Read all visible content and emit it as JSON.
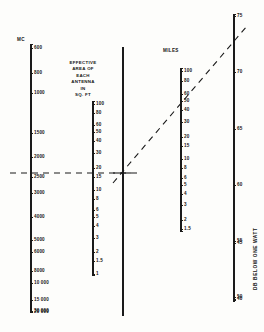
{
  "figure": {
    "type": "nomogram",
    "background_color": "#fdfdfb",
    "line_color": "#1a1a1a"
  },
  "scales": {
    "frequency": {
      "title": "MC",
      "axis_x": 30,
      "axis_top": 44,
      "axis_bottom": 312,
      "tick_side": "right",
      "label_dx": 4,
      "ticks": [
        {
          "label": "600",
          "y": 48
        },
        {
          "label": "800",
          "y": 73
        },
        {
          "label": "1000",
          "y": 93
        },
        {
          "label": "1500",
          "y": 133
        },
        {
          "label": "2000",
          "y": 157
        },
        {
          "label": "2500",
          "y": 177
        },
        {
          "label": "3000",
          "y": 193
        },
        {
          "label": "4000",
          "y": 217
        },
        {
          "label": "5000",
          "y": 240
        },
        {
          "label": "6000",
          "y": 252
        },
        {
          "label": "8000",
          "y": 271
        },
        {
          "label": "10 000",
          "y": 283
        },
        {
          "label": "15 000",
          "y": 300
        },
        {
          "label": "20 000",
          "y": 312
        }
      ]
    },
    "area": {
      "title_lines": [
        "EFFECTIVE",
        "AREA OF",
        "EACH",
        "ANTENNA",
        "IN",
        "SQ. FT"
      ],
      "title_x": 52,
      "title_y": 62,
      "axis_x": 92,
      "axis_top": 101,
      "axis_bottom": 266,
      "tick_side": "right",
      "label_dx": 4,
      "ticks": [
        {
          "label": "100",
          "y": 104
        },
        {
          "label": "80",
          "y": 113
        },
        {
          "label": "60",
          "y": 125
        },
        {
          "label": "50",
          "y": 132
        },
        {
          "label": "40",
          "y": 141
        },
        {
          "label": "30",
          "y": 153
        },
        {
          "label": "20",
          "y": 168
        },
        {
          "label": "15",
          "y": 177
        },
        {
          "label": "10",
          "y": 190
        },
        {
          "label": "8",
          "y": 199
        },
        {
          "label": "6",
          "y": 210
        },
        {
          "label": "5",
          "y": 217
        },
        {
          "label": "4",
          "y": 226
        },
        {
          "label": "3",
          "y": 238
        },
        {
          "label": "2",
          "y": 252
        },
        {
          "label": "1.5",
          "y": 261
        },
        {
          "label": "1",
          "y": 274
        }
      ]
    },
    "miles": {
      "title": "MILES",
      "title_x": 164,
      "title_y": 52,
      "axis_x": 180,
      "axis_top": 68,
      "axis_bottom": 223,
      "tick_side": "right",
      "label_dx": 4,
      "ticks": [
        {
          "label": "100",
          "y": 71
        },
        {
          "label": "80",
          "y": 81
        },
        {
          "label": "60",
          "y": 94
        },
        {
          "label": "50",
          "y": 101
        },
        {
          "label": "40",
          "y": 110
        },
        {
          "label": "30",
          "y": 122
        },
        {
          "label": "20",
          "y": 137
        },
        {
          "label": "15",
          "y": 146
        },
        {
          "label": "10",
          "y": 159
        },
        {
          "label": "8",
          "y": 168
        },
        {
          "label": "6",
          "y": 178
        },
        {
          "label": "5",
          "y": 185
        },
        {
          "label": "4",
          "y": 194
        },
        {
          "label": "3",
          "y": 205
        },
        {
          "label": "2",
          "y": 220
        },
        {
          "label": "1.5",
          "y": 229
        }
      ]
    },
    "db": {
      "title": "DB BELOW ONE WATT",
      "title_x": 255,
      "title_y": 240,
      "axis_x": 233,
      "axis_top": 14,
      "axis_bottom": 297,
      "tick_side": "right",
      "label_dx": 4,
      "ticks": [
        {
          "label": "75",
          "y": 16
        },
        {
          "label": "70",
          "y": 72
        },
        {
          "label": "65",
          "y": 129
        },
        {
          "label": "60",
          "y": 185
        },
        {
          "label": "55",
          "y": 241
        },
        {
          "label": "50",
          "y": 297
        }
      ]
    }
  },
  "pivot_axis": {
    "x": 122,
    "top": 47,
    "bottom": 316,
    "label": "pivot-line"
  },
  "construction_lines": {
    "horizontal": {
      "name": "index-line-horizontal",
      "y": 173,
      "x_start": 10,
      "x_end": 140,
      "style": "dashed",
      "reads": {
        "frequency_mc": "4000",
        "area_sq_ft": "10"
      }
    },
    "diagonal": {
      "name": "index-line-diagonal",
      "x_start": 113,
      "y_start": 183,
      "x_end": 247,
      "y_end": 26,
      "style": "dashed",
      "reads": {
        "miles": "30",
        "db_below_one_watt": "72"
      }
    },
    "pivot_cross": {
      "name": "pivot-cross-mark",
      "x": 122,
      "y": 173,
      "half_width": 9
    }
  },
  "chart_data": {
    "type": "nomogram",
    "title": "",
    "axes": [
      {
        "name": "MC",
        "label": "MC",
        "values": [
          600,
          800,
          1000,
          1500,
          2000,
          2500,
          3000,
          4000,
          5000,
          6000,
          8000,
          10000,
          15000,
          20000,
          30000
        ],
        "tick_labels": [
          "600",
          "800",
          "1000",
          "1500",
          "2000",
          "2500",
          "3000",
          "4000",
          "5000",
          "6000",
          "8000",
          "10 000",
          "15 000",
          "20 000",
          "30 000"
        ],
        "orientation": "vertical",
        "direction": "increasing-downward"
      },
      {
        "name": "EFFECTIVE AREA OF EACH ANTENNA IN SQ. FT",
        "label": "EFFECTIVE AREA OF EACH ANTENNA IN SQ. FT",
        "values": [
          100,
          80,
          60,
          50,
          40,
          30,
          20,
          15,
          10,
          8,
          6,
          5,
          4,
          3,
          2,
          1.5,
          1
        ],
        "tick_labels": [
          "100",
          "80",
          "60",
          "50",
          "40",
          "30",
          "20",
          "15",
          "10",
          "8",
          "6",
          "5",
          "4",
          "3",
          "2",
          "1.5",
          "1"
        ],
        "orientation": "vertical",
        "direction": "decreasing-downward"
      },
      {
        "name": "MILES",
        "label": "MILES",
        "values": [
          100,
          80,
          60,
          50,
          40,
          30,
          20,
          15,
          10,
          8,
          6,
          5,
          4,
          3,
          2,
          1.5
        ],
        "tick_labels": [
          "100",
          "80",
          "60",
          "50",
          "40",
          "30",
          "20",
          "15",
          "10",
          "8",
          "6",
          "5",
          "4",
          "3",
          "2",
          "1.5"
        ],
        "orientation": "vertical",
        "direction": "decreasing-downward"
      },
      {
        "name": "DB BELOW ONE WATT",
        "label": "DB BELOW ONE WATT",
        "values": [
          75,
          70,
          65,
          60,
          55,
          50,
          45,
          40
        ],
        "tick_labels": [
          "75",
          "70",
          "65",
          "60",
          "55",
          "50",
          "45",
          "40"
        ],
        "orientation": "vertical",
        "direction": "decreasing-downward"
      }
    ],
    "example_solution": {
      "frequency_mc": 4000,
      "effective_area_sq_ft": 10,
      "miles": 30,
      "db_below_one_watt": 72
    }
  }
}
